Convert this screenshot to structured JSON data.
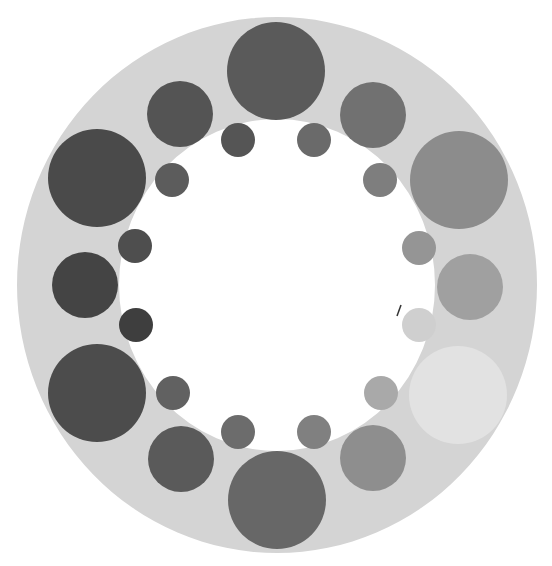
{
  "figure": {
    "background": "#ffffff",
    "ring": {
      "cx": 277,
      "cy": 285,
      "outer_rx": 260,
      "outer_ry": 268,
      "inner_rx": 158,
      "inner_ry": 166,
      "color": "#d4d4d4"
    },
    "large_circles": [
      {
        "cx": 276,
        "cy": 71,
        "r": 49,
        "color": "#5a5a5a"
      },
      {
        "cx": 459,
        "cy": 180,
        "r": 49,
        "color": "#8c8c8c"
      },
      {
        "cx": 458,
        "cy": 395,
        "r": 49,
        "color": "#e2e2e2"
      },
      {
        "cx": 277,
        "cy": 500,
        "r": 49,
        "color": "#676767"
      },
      {
        "cx": 97,
        "cy": 393,
        "r": 49,
        "color": "#4c4c4c"
      },
      {
        "cx": 97,
        "cy": 178,
        "r": 49,
        "color": "#4a4a4a"
      }
    ],
    "medium_circles": [
      {
        "cx": 373,
        "cy": 115,
        "r": 33,
        "color": "#717171"
      },
      {
        "cx": 470,
        "cy": 287,
        "r": 33,
        "color": "#a0a0a0"
      },
      {
        "cx": 373,
        "cy": 458,
        "r": 33,
        "color": "#8e8e8e"
      },
      {
        "cx": 181,
        "cy": 459,
        "r": 33,
        "color": "#5a5a5a"
      },
      {
        "cx": 85,
        "cy": 285,
        "r": 33,
        "color": "#444444"
      },
      {
        "cx": 180,
        "cy": 114,
        "r": 33,
        "color": "#545454"
      }
    ],
    "small_circles": [
      {
        "cx": 238,
        "cy": 140,
        "r": 17,
        "color": "#555555"
      },
      {
        "cx": 314,
        "cy": 140,
        "r": 17,
        "color": "#6a6a6a"
      },
      {
        "cx": 380,
        "cy": 180,
        "r": 17,
        "color": "#7e7e7e"
      },
      {
        "cx": 419,
        "cy": 248,
        "r": 17,
        "color": "#959595"
      },
      {
        "cx": 419,
        "cy": 325,
        "r": 17,
        "color": "#cfcfcf"
      },
      {
        "cx": 381,
        "cy": 393,
        "r": 17,
        "color": "#a9a9a9"
      },
      {
        "cx": 314,
        "cy": 432,
        "r": 17,
        "color": "#808080"
      },
      {
        "cx": 238,
        "cy": 432,
        "r": 17,
        "color": "#6c6c6c"
      },
      {
        "cx": 173,
        "cy": 393,
        "r": 17,
        "color": "#616161"
      },
      {
        "cx": 136,
        "cy": 325,
        "r": 17,
        "color": "#3e3e3e"
      },
      {
        "cx": 135,
        "cy": 246,
        "r": 17,
        "color": "#4e4e4e"
      },
      {
        "cx": 172,
        "cy": 180,
        "r": 17,
        "color": "#5c5c5c"
      }
    ],
    "artifact_mark": {
      "x1": 397,
      "y1": 316,
      "x2": 401,
      "y2": 305,
      "color": "#333333"
    }
  }
}
